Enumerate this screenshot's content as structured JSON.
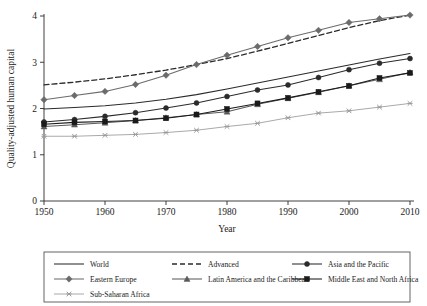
{
  "figure": {
    "clipped_title_fragment": "",
    "background_color": "#ffffff"
  },
  "axes": {
    "y_title": "Quality-adjusted human capital",
    "x_title": "Year",
    "y_ticks": [
      "0",
      "1",
      "2",
      "3",
      "4"
    ],
    "x_ticks": [
      "1950",
      "1960",
      "1970",
      "1980",
      "1990",
      "2000",
      "2010"
    ]
  },
  "legend": {
    "items": [
      {
        "label": "World",
        "marker": "none",
        "dash": "solid",
        "color": "#2b2b2b"
      },
      {
        "label": "Advanced",
        "marker": "none",
        "dash": "dashed",
        "color": "#2b2b2b"
      },
      {
        "label": "Asia and the Pacific",
        "marker": "circle",
        "dash": "solid",
        "color": "#2b2b2b"
      },
      {
        "label": "Eastern Europe",
        "marker": "diamond",
        "dash": "solid",
        "color": "#6b6b6b"
      },
      {
        "label": "Latin America and the Caribbean",
        "marker": "triangle",
        "dash": "solid",
        "color": "#5a5a5a"
      },
      {
        "label": "Middle East and North Africa",
        "marker": "square",
        "dash": "solid",
        "color": "#1a1a1a"
      },
      {
        "label": "Sub-Saharan Africa",
        "marker": "cross",
        "dash": "solid",
        "color": "#9a9a9a"
      }
    ]
  },
  "chart_data": {
    "type": "line",
    "title": "",
    "xlabel": "Year",
    "ylabel": "Quality-adjusted human capital",
    "xlim": [
      1950,
      2010
    ],
    "ylim": [
      0,
      4.3
    ],
    "grid": false,
    "legend_position": "bottom",
    "x": [
      1950,
      1955,
      1960,
      1965,
      1970,
      1975,
      1980,
      1985,
      1990,
      1995,
      2000,
      2005,
      2010
    ],
    "series": [
      {
        "name": "World",
        "marker": "none",
        "dash": "solid",
        "color": "#2b2b2b",
        "values": [
          1.99,
          2.02,
          2.06,
          2.12,
          2.2,
          2.3,
          2.42,
          2.55,
          2.68,
          2.81,
          2.94,
          3.07,
          3.19
        ]
      },
      {
        "name": "Advanced",
        "marker": "none",
        "dash": "dashed",
        "color": "#2b2b2b",
        "values": [
          2.51,
          2.57,
          2.64,
          2.73,
          2.83,
          2.95,
          3.08,
          3.24,
          3.41,
          3.58,
          3.75,
          3.9,
          4.02
        ]
      },
      {
        "name": "Asia and the Pacific",
        "marker": "circle",
        "dash": "solid",
        "color": "#2b2b2b",
        "values": [
          1.71,
          1.76,
          1.83,
          1.91,
          2.01,
          2.12,
          2.26,
          2.4,
          2.51,
          2.67,
          2.84,
          2.98,
          3.08
        ]
      },
      {
        "name": "Eastern Europe",
        "marker": "diamond",
        "dash": "solid",
        "color": "#6b6b6b",
        "values": [
          2.19,
          2.28,
          2.37,
          2.52,
          2.72,
          2.95,
          3.15,
          3.34,
          3.53,
          3.69,
          3.86,
          3.94,
          4.02
        ]
      },
      {
        "name": "Latin America and the Caribbean",
        "marker": "triangle",
        "dash": "solid",
        "color": "#5a5a5a",
        "values": [
          1.61,
          1.65,
          1.69,
          1.74,
          1.8,
          1.87,
          1.93,
          2.09,
          2.22,
          2.35,
          2.49,
          2.63,
          2.78
        ]
      },
      {
        "name": "Middle East and North Africa",
        "marker": "square",
        "dash": "solid",
        "color": "#1a1a1a",
        "values": [
          1.66,
          1.7,
          1.72,
          1.74,
          1.79,
          1.87,
          1.99,
          2.11,
          2.23,
          2.36,
          2.49,
          2.66,
          2.77
        ]
      },
      {
        "name": "Sub-Saharan Africa",
        "marker": "cross",
        "dash": "solid",
        "color": "#9a9a9a",
        "values": [
          1.4,
          1.4,
          1.42,
          1.44,
          1.48,
          1.53,
          1.61,
          1.68,
          1.8,
          1.9,
          1.95,
          2.03,
          2.11
        ]
      }
    ]
  }
}
